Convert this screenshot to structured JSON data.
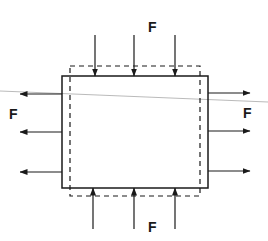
{
  "diagram": {
    "title": "",
    "colors": {
      "stroke": "#1a1a1a",
      "guide_line": "#a8a8a8",
      "background": "#ffffff"
    },
    "labels": {
      "top": "F",
      "left": "F",
      "right": "F",
      "bottom": "F"
    },
    "solid_rect": {
      "x": 62,
      "y": 76,
      "width": 146,
      "height": 112
    },
    "dashed_rect": {
      "x": 70,
      "y": 66,
      "width": 130,
      "height": 130
    },
    "arrows": {
      "top": [
        {
          "x": 95
        },
        {
          "x": 134
        },
        {
          "x": 175
        }
      ],
      "bottom": [
        {
          "x": 93
        },
        {
          "x": 134
        },
        {
          "x": 175
        }
      ],
      "left": [
        {
          "y": 94
        },
        {
          "y": 132
        },
        {
          "y": 172
        }
      ],
      "right": [
        {
          "y": 93
        },
        {
          "y": 131
        },
        {
          "y": 171
        }
      ]
    }
  }
}
